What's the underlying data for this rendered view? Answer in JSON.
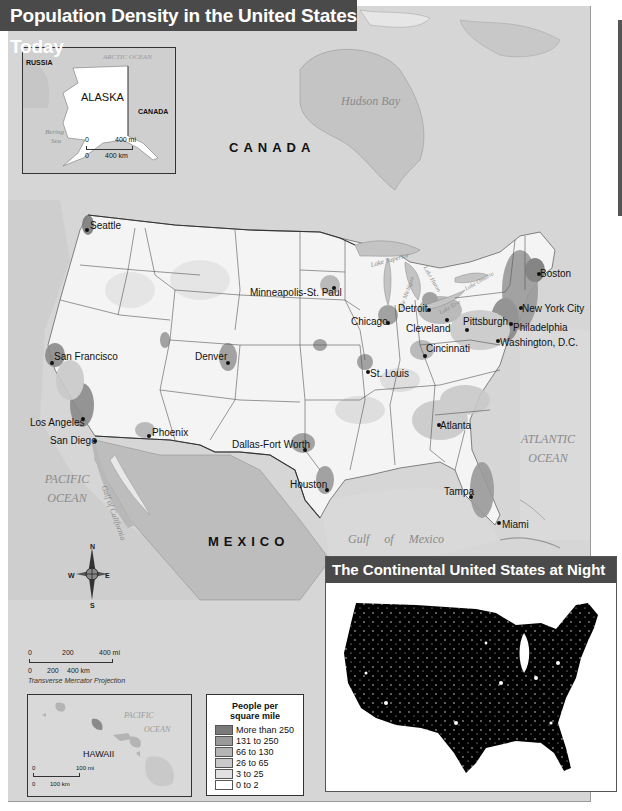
{
  "title": "Population Density in the United States Today",
  "alaska_inset": {
    "labels": {
      "russia": "RUSSIA",
      "alaska": "ALASKA",
      "canada": "CANADA",
      "arctic_ocean": "ARCTIC OCEAN",
      "bering_sea_1": "Bering",
      "bering_sea_2": "Sea"
    },
    "scale": {
      "mi_zero": "0",
      "mi_value": "400 mi",
      "km_zero": "0",
      "km_value": "400 km"
    }
  },
  "main_map": {
    "countries": {
      "canada": "CANADA",
      "mexico": "MEXICO"
    },
    "water": {
      "hudson_bay": "Hudson Bay",
      "pacific_1": "PACIFIC",
      "pacific_2": "OCEAN",
      "atlantic_1": "ATLANTIC",
      "atlantic_2": "OCEAN",
      "gulf_of_mexico": "Gulf     of     Mexico",
      "gulf_of_california": "Gulf of California",
      "lake_superior": "Lake Superior",
      "lake_michigan": "Lake Michigan",
      "lake_huron": "Lake Huron",
      "lake_erie": "Lake Erie",
      "lake_ontario": "Lake Ontario"
    },
    "cities": [
      {
        "name": "Seattle",
        "x": 85,
        "y": 228
      },
      {
        "name": "Minneapolis-St. Paul",
        "x": 332,
        "y": 286
      },
      {
        "name": "Chicago",
        "x": 386,
        "y": 320
      },
      {
        "name": "Detroit",
        "x": 428,
        "y": 305
      },
      {
        "name": "Cleveland",
        "x": 445,
        "y": 314
      },
      {
        "name": "Pittsburgh",
        "x": 465,
        "y": 322
      },
      {
        "name": "Boston",
        "x": 537,
        "y": 268
      },
      {
        "name": "New York City",
        "x": 519,
        "y": 300
      },
      {
        "name": "Philadelphia",
        "x": 509,
        "y": 318
      },
      {
        "name": "Washington, D.C.",
        "x": 496,
        "y": 335
      },
      {
        "name": "San Francisco",
        "x": 50,
        "y": 357
      },
      {
        "name": "Denver",
        "x": 226,
        "y": 357
      },
      {
        "name": "Cincinnati",
        "x": 423,
        "y": 348
      },
      {
        "name": "St. Louis",
        "x": 366,
        "y": 366
      },
      {
        "name": "Los Angeles",
        "x": 81,
        "y": 413
      },
      {
        "name": "San Diego",
        "x": 93,
        "y": 435
      },
      {
        "name": "Phoenix",
        "x": 147,
        "y": 430
      },
      {
        "name": "Atlanta",
        "x": 437,
        "y": 420
      },
      {
        "name": "Dallas-Fort Worth",
        "x": 303,
        "y": 443
      },
      {
        "name": "Houston",
        "x": 325,
        "y": 483
      },
      {
        "name": "Tampa",
        "x": 469,
        "y": 490
      },
      {
        "name": "Miami",
        "x": 497,
        "y": 517
      }
    ],
    "compass": {
      "n": "N",
      "s": "S",
      "e": "E",
      "w": "W"
    },
    "scale": {
      "mi_zero": "0",
      "mi_mid": "200",
      "mi_value": "400 mi",
      "km_zero": "0",
      "km_mid": "200",
      "km_value": "400 km"
    },
    "projection": "Transverse Mercator Projection"
  },
  "hawaii_inset": {
    "label": "HAWAII",
    "pacific_1": "PACIFIC",
    "pacific_2": "OCEAN",
    "scale": {
      "mi_zero": "0",
      "mi_value": "100 mi",
      "km_zero": "0",
      "km_value": "100 km"
    }
  },
  "legend": {
    "title_1": "People per",
    "title_2": "square mile",
    "items": [
      {
        "label": "More than 250",
        "color": "#7a7a7a"
      },
      {
        "label": "131 to 250",
        "color": "#9a9a9a"
      },
      {
        "label": "66 to 130",
        "color": "#b4b4b4"
      },
      {
        "label": "26 to 65",
        "color": "#c9c9c9"
      },
      {
        "label": "3 to 25",
        "color": "#e2e2e2"
      },
      {
        "label": "0 to 2",
        "color": "#ffffff"
      }
    ]
  },
  "night_inset": {
    "title": "The Continental United States at Night"
  },
  "colors": {
    "banner": "#4a4a4a",
    "land_foreign": "#d6d6d6",
    "water": "#c8c8c8",
    "us_land": "#f4f4f4"
  }
}
